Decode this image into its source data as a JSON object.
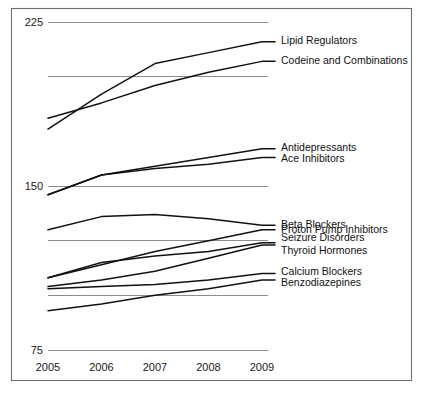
{
  "chart_data": {
    "type": "line",
    "title": "",
    "subtitle": "",
    "xlabel": "",
    "ylabel": "",
    "x": [
      2005,
      2006,
      2007,
      2008,
      2009
    ],
    "categories": [
      "2005",
      "2006",
      "2007",
      "2008",
      "2009"
    ],
    "xtick_labels": [
      "2005",
      "2006",
      "2007",
      "2008",
      "2009"
    ],
    "ytick_labels": [
      "225",
      "150",
      "75"
    ],
    "ytick_values": [
      225,
      150,
      75
    ],
    "gridline_values": [
      225,
      200,
      150,
      125,
      100,
      75
    ],
    "grid": true,
    "legend_position": "right-inline-labels",
    "ylim": [
      75,
      225
    ],
    "xlim": [
      2005,
      2009
    ],
    "series": [
      {
        "name": "Lipid Regulators",
        "label": "Lipid Regulators",
        "values": [
          176,
          192,
          206,
          211,
          216
        ]
      },
      {
        "name": "Codeine and Combinations",
        "label": "Codeine and Combinations",
        "values": [
          181,
          188,
          196,
          202,
          207
        ]
      },
      {
        "name": "Antidepressants",
        "label": "Antidepressants",
        "values": [
          146,
          155,
          159,
          163,
          167
        ]
      },
      {
        "name": "Ace Inhibitors",
        "label": "Ace Inhibitors",
        "values": [
          146,
          155,
          158,
          160,
          163
        ]
      },
      {
        "name": "Beta Blockers",
        "label": "Beta Blockers",
        "values": [
          130,
          136,
          137,
          135,
          132
        ]
      },
      {
        "name": "Proton Pump Inhibitors",
        "label": "Proton Pump Inhibitors",
        "values": [
          108,
          114,
          120,
          125,
          130
        ]
      },
      {
        "name": "Seizure Disorders",
        "label": "Seizure Disorders",
        "values": [
          108,
          115,
          118,
          120,
          124
        ]
      },
      {
        "name": "Thyroid Hormones",
        "label": "Thyroid Hormones",
        "values": [
          104,
          107,
          111,
          117,
          123
        ]
      },
      {
        "name": "Calcium Blockers",
        "label": "Calcium Blockers",
        "values": [
          103,
          104,
          105,
          107,
          110
        ]
      },
      {
        "name": "Benzodiazepines",
        "label": "Benzodiazepines",
        "values": [
          93,
          96,
          100,
          103,
          107
        ]
      }
    ],
    "colors": {
      "line": "#111111",
      "grid": "#8c8c8c",
      "frame": "#6e6e6e",
      "text": "#1a1a1a",
      "background": "#ffffff"
    }
  }
}
